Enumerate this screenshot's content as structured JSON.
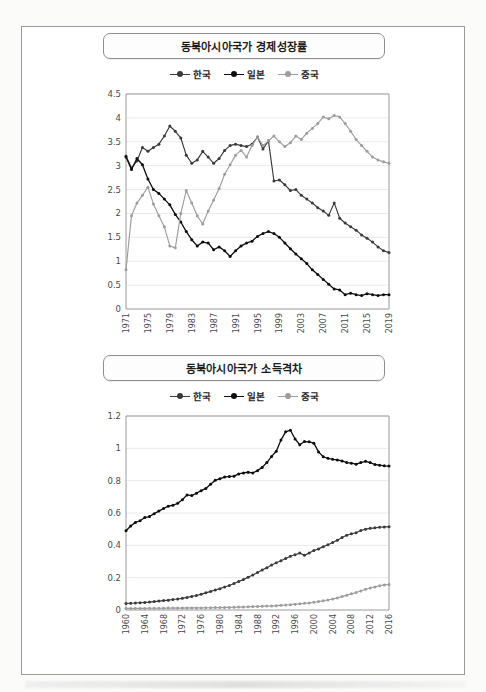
{
  "document": {
    "background_color": "#fbfbfa",
    "sheet_border_color": "#9a9a9a"
  },
  "colors": {
    "korea": "#3a3a3a",
    "japan": "#0d0d0d",
    "china": "#9d9d9d",
    "axis": "#9a9a9a",
    "grid": "#eaeaea"
  },
  "charts": [
    {
      "title": "동북아시아국가 경제성장률",
      "legend": [
        "한국",
        "일본",
        "중국"
      ]
    },
    {
      "title": "동북아시아국가 소득격차",
      "legend": [
        "한국",
        "일본",
        "중국"
      ]
    }
  ],
  "chart_data": [
    {
      "type": "line",
      "title": "동북아시아국가 경제성장률",
      "xlabel": "",
      "ylabel": "",
      "xlim": [
        1971,
        2019
      ],
      "ylim": [
        0,
        4.5
      ],
      "ytick_step": 0.5,
      "yticks": [
        0,
        0.5,
        1,
        1.5,
        2,
        2.5,
        3,
        3.5,
        4,
        4.5
      ],
      "xticks": [
        1971,
        1975,
        1979,
        1983,
        1987,
        1991,
        1995,
        1999,
        2003,
        2007,
        2011,
        2015,
        2019
      ],
      "grid": true,
      "legend_position": "top-center",
      "x": [
        1971,
        1972,
        1973,
        1974,
        1975,
        1976,
        1977,
        1978,
        1979,
        1980,
        1981,
        1982,
        1983,
        1984,
        1985,
        1986,
        1987,
        1988,
        1989,
        1990,
        1991,
        1992,
        1993,
        1994,
        1995,
        1996,
        1997,
        1998,
        1999,
        2000,
        2001,
        2002,
        2003,
        2004,
        2005,
        2006,
        2007,
        2008,
        2009,
        2010,
        2011,
        2012,
        2013,
        2014,
        2015,
        2016,
        2017,
        2018,
        2019
      ],
      "series": [
        {
          "name": "한국",
          "color": "#3a3a3a",
          "values": [
            3.2,
            2.95,
            3.1,
            3.38,
            3.3,
            3.38,
            3.45,
            3.62,
            3.83,
            3.72,
            3.58,
            3.22,
            3.05,
            3.12,
            3.3,
            3.18,
            3.05,
            3.15,
            3.32,
            3.42,
            3.45,
            3.42,
            3.4,
            3.45,
            3.6,
            3.35,
            3.52,
            2.68,
            2.7,
            2.6,
            2.48,
            2.5,
            2.38,
            2.3,
            2.22,
            2.12,
            2.05,
            1.96,
            2.22,
            1.9,
            1.8,
            1.72,
            1.65,
            1.55,
            1.48,
            1.4,
            1.3,
            1.22,
            1.18
          ]
        },
        {
          "name": "일본",
          "color": "#0d0d0d",
          "values": [
            3.18,
            2.92,
            3.15,
            3.02,
            2.72,
            2.5,
            2.42,
            2.3,
            2.18,
            1.98,
            1.82,
            1.62,
            1.45,
            1.32,
            1.4,
            1.38,
            1.24,
            1.3,
            1.22,
            1.1,
            1.22,
            1.32,
            1.38,
            1.42,
            1.52,
            1.58,
            1.62,
            1.58,
            1.5,
            1.38,
            1.26,
            1.15,
            1.05,
            0.95,
            0.82,
            0.72,
            0.62,
            0.52,
            0.42,
            0.4,
            0.3,
            0.33,
            0.3,
            0.28,
            0.32,
            0.3,
            0.28,
            0.3,
            0.3
          ]
        },
        {
          "name": "중국",
          "color": "#9d9d9d",
          "values": [
            0.82,
            1.95,
            2.22,
            2.38,
            2.55,
            2.2,
            1.95,
            1.72,
            1.32,
            1.28,
            2.0,
            2.48,
            2.22,
            1.95,
            1.78,
            2.05,
            2.28,
            2.52,
            2.82,
            3.02,
            3.22,
            3.32,
            3.18,
            3.42,
            3.6,
            3.42,
            3.52,
            3.62,
            3.5,
            3.4,
            3.48,
            3.62,
            3.55,
            3.68,
            3.78,
            3.88,
            4.02,
            3.98,
            4.05,
            4.02,
            3.88,
            3.72,
            3.55,
            3.42,
            3.3,
            3.18,
            3.12,
            3.08,
            3.05
          ]
        }
      ]
    },
    {
      "type": "line",
      "title": "동북아시아국가 소득격차",
      "xlabel": "",
      "ylabel": "",
      "xlim": [
        1960,
        2016
      ],
      "ylim": [
        0,
        1.2
      ],
      "ytick_step": 0.2,
      "yticks": [
        0,
        0.2,
        0.4,
        0.6,
        0.8,
        1,
        1.2
      ],
      "xticks": [
        1960,
        1964,
        1968,
        1972,
        1976,
        1980,
        1984,
        1988,
        1992,
        1996,
        2000,
        2004,
        2008,
        2012,
        2016
      ],
      "grid": true,
      "legend_position": "top-center",
      "x": [
        1960,
        1961,
        1962,
        1963,
        1964,
        1965,
        1966,
        1967,
        1968,
        1969,
        1970,
        1971,
        1972,
        1973,
        1974,
        1975,
        1976,
        1977,
        1978,
        1979,
        1980,
        1981,
        1982,
        1983,
        1984,
        1985,
        1986,
        1987,
        1988,
        1989,
        1990,
        1991,
        1992,
        1993,
        1994,
        1995,
        1996,
        1997,
        1998,
        1999,
        2000,
        2001,
        2002,
        2003,
        2004,
        2005,
        2006,
        2007,
        2008,
        2009,
        2010,
        2011,
        2012,
        2013,
        2014,
        2015,
        2016
      ],
      "series": [
        {
          "name": "한국",
          "color": "#3a3a3a",
          "values": [
            0.04,
            0.042,
            0.043,
            0.045,
            0.047,
            0.049,
            0.052,
            0.055,
            0.058,
            0.061,
            0.065,
            0.068,
            0.072,
            0.078,
            0.084,
            0.09,
            0.098,
            0.106,
            0.115,
            0.124,
            0.132,
            0.142,
            0.152,
            0.164,
            0.176,
            0.188,
            0.202,
            0.216,
            0.232,
            0.248,
            0.262,
            0.278,
            0.292,
            0.305,
            0.318,
            0.332,
            0.342,
            0.352,
            0.338,
            0.352,
            0.368,
            0.378,
            0.392,
            0.404,
            0.418,
            0.432,
            0.448,
            0.462,
            0.472,
            0.478,
            0.492,
            0.5,
            0.505,
            0.508,
            0.512,
            0.514,
            0.515
          ]
        },
        {
          "name": "일본",
          "color": "#0d0d0d",
          "values": [
            0.49,
            0.52,
            0.542,
            0.552,
            0.572,
            0.578,
            0.596,
            0.612,
            0.628,
            0.642,
            0.648,
            0.66,
            0.682,
            0.712,
            0.708,
            0.722,
            0.738,
            0.752,
            0.778,
            0.802,
            0.812,
            0.822,
            0.826,
            0.828,
            0.842,
            0.848,
            0.852,
            0.848,
            0.862,
            0.882,
            0.912,
            0.95,
            0.982,
            1.052,
            1.102,
            1.112,
            1.058,
            1.022,
            1.042,
            1.04,
            1.032,
            0.978,
            0.948,
            0.938,
            0.932,
            0.928,
            0.922,
            0.912,
            0.908,
            0.902,
            0.912,
            0.92,
            0.912,
            0.9,
            0.896,
            0.892,
            0.89
          ]
        },
        {
          "name": "중국",
          "color": "#9d9d9d",
          "values": [
            0.01,
            0.01,
            0.01,
            0.01,
            0.01,
            0.011,
            0.011,
            0.011,
            0.011,
            0.012,
            0.012,
            0.012,
            0.012,
            0.013,
            0.013,
            0.013,
            0.013,
            0.014,
            0.014,
            0.015,
            0.015,
            0.016,
            0.016,
            0.017,
            0.018,
            0.019,
            0.02,
            0.021,
            0.022,
            0.023,
            0.024,
            0.025,
            0.027,
            0.029,
            0.031,
            0.033,
            0.036,
            0.038,
            0.041,
            0.044,
            0.048,
            0.052,
            0.057,
            0.062,
            0.068,
            0.075,
            0.083,
            0.092,
            0.1,
            0.108,
            0.118,
            0.128,
            0.136,
            0.143,
            0.15,
            0.155,
            0.158
          ]
        }
      ]
    }
  ]
}
